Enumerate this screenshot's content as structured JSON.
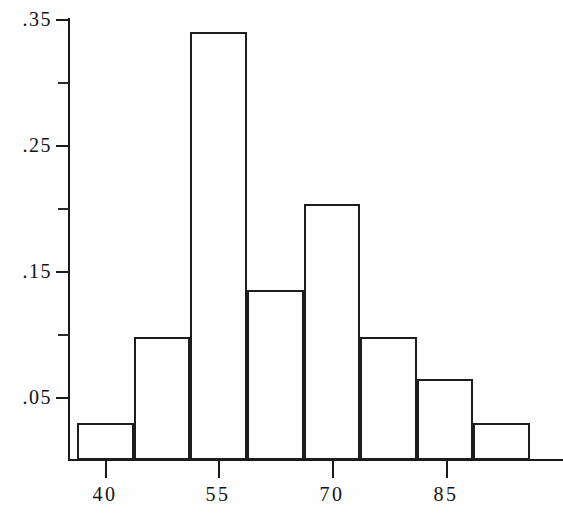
{
  "chart_data": {
    "type": "bar",
    "title": "",
    "subtitle": "",
    "xlabel": "",
    "ylabel": "",
    "grid": false,
    "legend": false,
    "xlim": [
      33.75,
      93.75
    ],
    "ylim": [
      0,
      0.36
    ],
    "x_tick_labels": [
      "40",
      "55",
      "70",
      "85"
    ],
    "x_tick_values": [
      40,
      55,
      70,
      85
    ],
    "y_tick_labels": [
      ".35",
      ".25",
      ".15",
      ".05"
    ],
    "y_tick_values": [
      0.35,
      0.25,
      0.15,
      0.05
    ],
    "y_minor_tick_values": [
      0.3,
      0.2,
      0.1
    ],
    "bin_edges": [
      33.75,
      41.25,
      48.75,
      56.25,
      63.75,
      71.25,
      78.75,
      86.25,
      93.75
    ],
    "categories": [
      "33.75-41.25",
      "41.25-48.75",
      "48.75-56.25",
      "56.25-63.75",
      "63.75-71.25",
      "71.25-78.75",
      "78.75-86.25",
      "86.25-93.75"
    ],
    "values": [
      0.029,
      0.098,
      0.34,
      0.135,
      0.203,
      0.098,
      0.064,
      0.029
    ],
    "bars": [
      {
        "label": "bin-1",
        "value": 0.029
      },
      {
        "label": "bin-2",
        "value": 0.098
      },
      {
        "label": "bin-3",
        "value": 0.34
      },
      {
        "label": "bin-4",
        "value": 0.135
      },
      {
        "label": "bin-5",
        "value": 0.203
      },
      {
        "label": "bin-6",
        "value": 0.098
      },
      {
        "label": "bin-7",
        "value": 0.064
      },
      {
        "label": "bin-8",
        "value": 0.029
      }
    ],
    "colors": {
      "bar_edge": "#1d1d1d",
      "bar_fill": "none",
      "axis": "#1a1a1a",
      "text": "#121212",
      "background": "#fefefe"
    }
  }
}
